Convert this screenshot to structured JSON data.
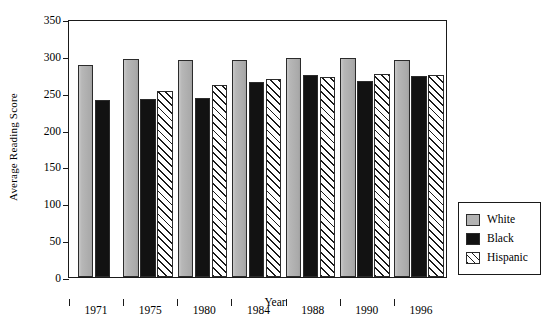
{
  "chart_data": {
    "type": "bar",
    "title": "",
    "xlabel": "Year",
    "ylabel": "Average Reading Score",
    "categories": [
      "1971",
      "1975",
      "1980",
      "1984",
      "1988",
      "1990",
      "1996"
    ],
    "series": [
      {
        "name": "White",
        "values": [
          287,
          296,
          295,
          295,
          297,
          297,
          295
        ]
      },
      {
        "name": "Black",
        "values": [
          240,
          242,
          243,
          264,
          274,
          266,
          273
        ]
      },
      {
        "name": "Hispanic",
        "values": [
          null,
          252,
          261,
          268,
          271,
          275,
          274
        ]
      }
    ],
    "ylim": [
      0,
      350
    ],
    "ytick_values": [
      0,
      50,
      100,
      150,
      200,
      250,
      300,
      350
    ],
    "ytick_labels": [
      "0",
      "50",
      "100",
      "150",
      "200",
      "250",
      "300",
      "350"
    ],
    "grid": false,
    "legend_position": "right-outside",
    "legend_entries": [
      "White",
      "Black",
      "Hispanic"
    ],
    "colors": {
      "white_series": "#b3b3b3",
      "black_series": "#121212",
      "hispanic_series": "#ffffff",
      "hispanic_hatch": "#1a1a1a",
      "axis": "#1a1a1a",
      "background": "#ffffff"
    }
  }
}
